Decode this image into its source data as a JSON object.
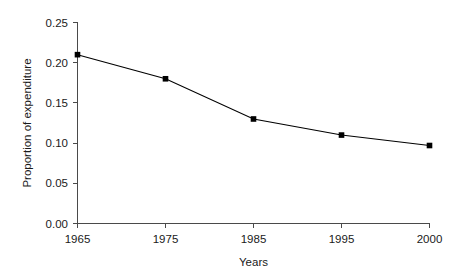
{
  "chart_data": {
    "type": "line",
    "title": "",
    "subtitle": "",
    "xlabel": "Years",
    "ylabel": "Proportion of expenditure",
    "categories": [
      "1965",
      "1975",
      "1985",
      "1995",
      "2000"
    ],
    "values": [
      0.21,
      0.18,
      0.13,
      0.11,
      0.097
    ],
    "series": [
      {
        "name": "Proportion of expenditure",
        "values": [
          0.21,
          0.18,
          0.13,
          0.11,
          0.097
        ],
        "color": "#000000",
        "marker": "square",
        "line_style": "solid"
      }
    ],
    "ylim": [
      0.0,
      0.25
    ],
    "ytick_labels": [
      "0.00",
      "0.05",
      "0.10",
      "0.15",
      "0.20",
      "0.25"
    ],
    "ytick_values": [
      0.0,
      0.05,
      0.1,
      0.15,
      0.2,
      0.25
    ],
    "xtick_labels": [
      "1965",
      "1975",
      "1985",
      "1995",
      "2000"
    ],
    "grid": false,
    "legend": false,
    "legend_position": "none",
    "tick_direction": "out",
    "axis_color": "#4a4a4a",
    "background": "#ffffff"
  },
  "axes": {
    "x_title": "Years",
    "y_title": "Proportion of expenditure"
  },
  "ticks": {
    "y": [
      {
        "label": "0.00",
        "value": 0.0
      },
      {
        "label": "0.05",
        "value": 0.05
      },
      {
        "label": "0.10",
        "value": 0.1
      },
      {
        "label": "0.15",
        "value": 0.15
      },
      {
        "label": "0.20",
        "value": 0.2
      },
      {
        "label": "0.25",
        "value": 0.25
      }
    ],
    "x": [
      {
        "label": "1965"
      },
      {
        "label": "1975"
      },
      {
        "label": "1985"
      },
      {
        "label": "1995"
      },
      {
        "label": "2000"
      }
    ]
  }
}
